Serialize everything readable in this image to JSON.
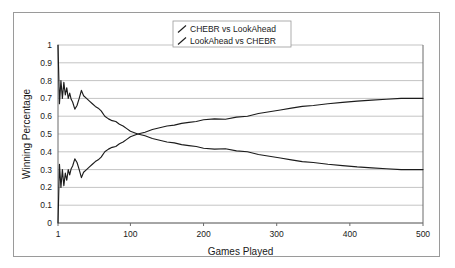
{
  "chart_data": {
    "type": "line",
    "title": "",
    "xlabel": "Games Played",
    "ylabel": "Winning Percentage",
    "xlim": [
      1,
      500
    ],
    "ylim": [
      0,
      1
    ],
    "grid": true,
    "legend_position": "top-center",
    "xticks": [
      "1",
      "100",
      "200",
      "300",
      "400",
      "500"
    ],
    "xtick_values": [
      1,
      100,
      200,
      300,
      400,
      500
    ],
    "yticks": [
      "0",
      "0.1",
      "0.2",
      "0.3",
      "0.4",
      "0.5",
      "0.6",
      "0.7",
      "0.8",
      "0.9",
      "1"
    ],
    "ytick_values": [
      0,
      0.1,
      0.2,
      0.3,
      0.4,
      0.5,
      0.6,
      0.7,
      0.8,
      0.9,
      1
    ],
    "series": [
      {
        "name": "CHEBR vs LookAhead",
        "color": "#1c1c1c",
        "x": [
          1,
          3,
          5,
          7,
          9,
          11,
          13,
          15,
          17,
          19,
          21,
          24,
          27,
          30,
          33,
          36,
          40,
          44,
          48,
          52,
          56,
          60,
          65,
          70,
          75,
          80,
          85,
          90,
          95,
          100,
          110,
          120,
          130,
          140,
          150,
          160,
          170,
          180,
          190,
          200,
          215,
          230,
          245,
          260,
          275,
          290,
          305,
          320,
          335,
          350,
          370,
          390,
          410,
          430,
          450,
          470,
          500
        ],
        "values": [
          1.0,
          0.67,
          0.8,
          0.7,
          0.79,
          0.72,
          0.76,
          0.7,
          0.73,
          0.695,
          0.68,
          0.64,
          0.66,
          0.7,
          0.745,
          0.715,
          0.7,
          0.685,
          0.67,
          0.655,
          0.645,
          0.63,
          0.6,
          0.585,
          0.575,
          0.57,
          0.555,
          0.545,
          0.53,
          0.515,
          0.5,
          0.49,
          0.475,
          0.465,
          0.455,
          0.45,
          0.44,
          0.435,
          0.43,
          0.42,
          0.415,
          0.417,
          0.405,
          0.4,
          0.385,
          0.375,
          0.365,
          0.355,
          0.345,
          0.34,
          0.33,
          0.322,
          0.315,
          0.31,
          0.305,
          0.3,
          0.3
        ]
      },
      {
        "name": "LookAhead vs CHEBR",
        "color": "#1c1c1c",
        "x": [
          1,
          3,
          5,
          7,
          9,
          11,
          13,
          15,
          17,
          19,
          21,
          24,
          27,
          30,
          33,
          36,
          40,
          44,
          48,
          52,
          56,
          60,
          65,
          70,
          75,
          80,
          85,
          90,
          95,
          100,
          110,
          120,
          130,
          140,
          150,
          160,
          170,
          180,
          190,
          200,
          215,
          230,
          245,
          260,
          275,
          290,
          305,
          320,
          335,
          350,
          370,
          390,
          410,
          430,
          450,
          470,
          500
        ],
        "values": [
          0.0,
          0.33,
          0.2,
          0.3,
          0.21,
          0.28,
          0.24,
          0.3,
          0.27,
          0.305,
          0.32,
          0.36,
          0.34,
          0.3,
          0.255,
          0.285,
          0.3,
          0.315,
          0.33,
          0.345,
          0.355,
          0.37,
          0.4,
          0.415,
          0.425,
          0.43,
          0.445,
          0.455,
          0.47,
          0.485,
          0.5,
          0.51,
          0.525,
          0.535,
          0.545,
          0.55,
          0.56,
          0.565,
          0.57,
          0.58,
          0.585,
          0.583,
          0.595,
          0.6,
          0.615,
          0.625,
          0.635,
          0.645,
          0.655,
          0.66,
          0.67,
          0.678,
          0.685,
          0.69,
          0.695,
          0.7,
          0.7
        ]
      }
    ]
  }
}
